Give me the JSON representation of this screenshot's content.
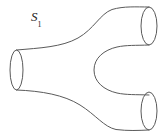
{
  "figure": {
    "background_color": "#ffffff",
    "stroke_color": "#5a5a5a",
    "stroke_width": 1,
    "width": 166,
    "height": 137,
    "labels": [
      {
        "name": "surface-label-s1",
        "base": "S",
        "subscript": "1",
        "text": "S₁",
        "x": 31,
        "y": 10,
        "font_size": 13,
        "italic": true,
        "color": "#222222"
      }
    ],
    "boundaries": [
      {
        "name": "left-opening",
        "role": "single leg opening (waist)",
        "shape": "ellipse",
        "cx": 16.5,
        "cy": 70,
        "rx": 6.5,
        "ry": 20
      },
      {
        "name": "top-right-opening",
        "role": "upper branch opening",
        "shape": "ellipse",
        "cx": 149,
        "cy": 26,
        "rx": 8,
        "ry": 19
      },
      {
        "name": "bottom-right-opening",
        "role": "lower branch opening",
        "shape": "ellipse",
        "cx": 149,
        "cy": 111,
        "rx": 8,
        "ry": 19
      }
    ],
    "paths": {
      "top_outline": "M 16.5 50 C 40 48 62 47 78 38 C 94 29 100 14 112 9.5 C 124 6 136 7 149 7",
      "bottom_outline": "M 16.5 90 C 42 91 64 95 80 105 C 96 115 104 127 116 129.5 C 128 131 138 130.5 149 130",
      "inner_notch": "M 149 45 C 136 45.5 126 45 117 47 C 104 50 94 58 94 70 C 94 82 104 90 117 93 C 126 95 136 94.5 149 95"
    }
  }
}
